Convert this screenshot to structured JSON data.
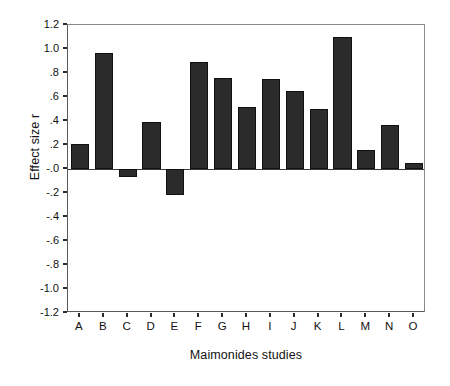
{
  "chart_data": {
    "type": "bar",
    "title": "",
    "xlabel": "Maimonides studies",
    "ylabel": "Effect size r",
    "categories": [
      "A",
      "B",
      "C",
      "D",
      "E",
      "F",
      "G",
      "H",
      "I",
      "J",
      "K",
      "L",
      "M",
      "N",
      "O"
    ],
    "values": [
      0.21,
      0.97,
      -0.07,
      0.39,
      -0.22,
      0.89,
      0.76,
      0.52,
      0.75,
      0.65,
      0.5,
      1.1,
      0.16,
      0.37,
      0.05
    ],
    "ylim": [
      -1.2,
      1.2
    ],
    "ytick_values": [
      1.2,
      1.0,
      0.8,
      0.6,
      0.4,
      0.2,
      -0.0,
      -0.2,
      -0.4,
      -0.6,
      -0.8,
      -1.0,
      -1.2
    ],
    "ytick_labels": [
      "1.2",
      "1.0",
      ".8",
      ".6",
      ".4",
      ".2",
      "-.0",
      "-.2",
      "-.4",
      "-.6",
      "-.8",
      "-1.0",
      "-1.2"
    ],
    "grid": false,
    "legend": false,
    "legend_position": "none",
    "bar_color": "#2b2b2b",
    "bar_edge_color": "#111111",
    "axis_color": "#5a5a5a",
    "background_color": "#ffffff"
  }
}
